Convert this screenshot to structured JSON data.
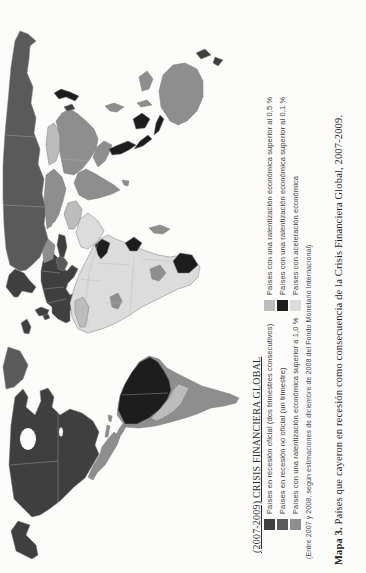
{
  "figure": {
    "caption_bold": "Mapa 3.",
    "caption_rest": " Países que cayeron en recesión como consecuencia de la Crisis Financiera Global, 2007-2009."
  },
  "legend": {
    "title": "(2007-2009) CRISIS FINANCIERA GLOBAL",
    "footnote": "(Entre 2007 y 2008, según estimaciones de diciembre de 2008 del Fondo Monetario Internacional)",
    "columns": [
      {
        "items": [
          {
            "label": "Países en recesión oficial (dos trimestres consecutivos)",
            "color": "#3f3f3f"
          },
          {
            "label": "Países en recesión no oficial (un trimestre)",
            "color": "#5a5a5a"
          },
          {
            "label": "Países con una ralentización económica superior a 1,0 %",
            "color": "#8e8e8e"
          }
        ]
      },
      {
        "items": [
          {
            "label": "Países con una ralentización económica superior al 0,5 %",
            "color": "#bcbcbc"
          },
          {
            "label": "Países con una ralentización económica superior al 0,1 %",
            "color": "#1d1d1d"
          },
          {
            "label": "Países con aceleración económica",
            "color": "#dcdcdc"
          }
        ]
      }
    ]
  },
  "map": {
    "ocean": "#fcfcfb",
    "border": "#7d7d7d",
    "category_colors": {
      "recesion_oficial": "#3f3f3f",
      "recesion_no_oficial": "#5a5a5a",
      "ralentizacion_1_0": "#8e8e8e",
      "ralentizacion_0_5": "#bcbcbc",
      "ralentizacion_0_1": "#1d1d1d",
      "aceleracion": "#dcdcdc"
    },
    "regions": [
      {
        "id": "alaska",
        "category": "recesion_oficial"
      },
      {
        "id": "canada-usa",
        "category": "recesion_oficial"
      },
      {
        "id": "greenland",
        "category": "recesion_no_oficial"
      },
      {
        "id": "mexico",
        "category": "ralentizacion_1_0"
      },
      {
        "id": "central-america",
        "category": "ralentizacion_1_0"
      },
      {
        "id": "cuba",
        "category": "ralentizacion_1_0"
      },
      {
        "id": "hispaniola",
        "category": "ralentizacion_1_0"
      },
      {
        "id": "south-america-south",
        "category": "ralentizacion_1_0"
      },
      {
        "id": "south-america-north",
        "category": "ralentizacion_0_1"
      },
      {
        "id": "peru-bolivia-paraguay",
        "category": "ralentizacion_0_5"
      },
      {
        "id": "iceland",
        "category": "recesion_oficial"
      },
      {
        "id": "uk",
        "category": "recesion_oficial"
      },
      {
        "id": "ireland",
        "category": "recesion_oficial"
      },
      {
        "id": "scandinavia",
        "category": "recesion_oficial"
      },
      {
        "id": "europe-west",
        "category": "recesion_oficial"
      },
      {
        "id": "ukraine",
        "category": "ralentizacion_1_0"
      },
      {
        "id": "balkans",
        "category": "recesion_no_oficial"
      },
      {
        "id": "russia",
        "category": "recesion_no_oficial"
      },
      {
        "id": "turkey",
        "category": "recesion_oficial"
      },
      {
        "id": "central-asia",
        "category": "ralentizacion_1_0"
      },
      {
        "id": "mongolia",
        "category": "ralentizacion_0_5"
      },
      {
        "id": "china",
        "category": "ralentizacion_1_0"
      },
      {
        "id": "korea",
        "category": "recesion_oficial"
      },
      {
        "id": "japan",
        "category": "ralentizacion_0_1"
      },
      {
        "id": "india",
        "category": "ralentizacion_1_0"
      },
      {
        "id": "sri-lanka",
        "category": "ralentizacion_1_0"
      },
      {
        "id": "iran",
        "category": "ralentizacion_0_5"
      },
      {
        "id": "arabia",
        "category": "aceleracion"
      },
      {
        "id": "africa-base",
        "category": "aceleracion"
      },
      {
        "id": "maghreb",
        "category": "ralentizacion_0_5"
      },
      {
        "id": "sudan-eritrea",
        "category": "ralentizacion_0_1"
      },
      {
        "id": "nigeria",
        "category": "ralentizacion_1_0"
      },
      {
        "id": "east-africa",
        "category": "ralentizacion_0_1"
      },
      {
        "id": "angola",
        "category": "ralentizacion_1_0"
      },
      {
        "id": "south-africa",
        "category": "ralentizacion_0_1"
      },
      {
        "id": "madagascar",
        "category": "ralentizacion_1_0"
      },
      {
        "id": "myanmar-vietnam",
        "category": "ralentizacion_1_0"
      },
      {
        "id": "thailand-malaysia",
        "category": "ralentizacion_0_1"
      },
      {
        "id": "indonesia",
        "category": "ralentizacion_0_1"
      },
      {
        "id": "sulawesi",
        "category": "ralentizacion_1_0"
      },
      {
        "id": "new-guinea",
        "category": "ralentizacion_1_0"
      },
      {
        "id": "philippines",
        "category": "ralentizacion_1_0"
      },
      {
        "id": "australia",
        "category": "ralentizacion_1_0"
      },
      {
        "id": "new-zealand",
        "category": "recesion_oficial"
      }
    ]
  }
}
